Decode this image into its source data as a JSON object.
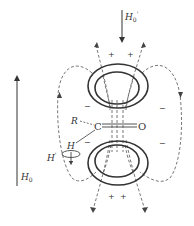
{
  "figure": {
    "type": "diagram",
    "labels": {
      "applied_field": "H",
      "applied_field_sub": "0",
      "induced_field_top": "H",
      "induced_field_top_sub": "0",
      "induced_field_top_prime": "'",
      "substituent": "R",
      "carbon": "C",
      "oxygen": "O",
      "hydrogen": "H",
      "local_field": "H",
      "local_field_prime": "'"
    },
    "shielding_regions": {
      "plus": "+",
      "minus": "−"
    },
    "colors": {
      "ink": "#333333",
      "dashed": "#555555",
      "background": "#ffffff"
    }
  }
}
